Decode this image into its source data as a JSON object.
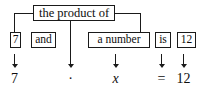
{
  "diagram": {
    "ink_color": "#1a1a1a",
    "background": "#ffffff",
    "phrase_boxes": [
      {
        "id": "product",
        "label": "the product of"
      },
      {
        "id": "seven",
        "label": "7"
      },
      {
        "id": "and",
        "label": "and"
      },
      {
        "id": "number",
        "label": "a number"
      },
      {
        "id": "is",
        "label": "is"
      },
      {
        "id": "twelve",
        "label": "12"
      }
    ],
    "arrows": [
      {
        "id": "arrow-1",
        "glyph": "down-arrow"
      },
      {
        "id": "arrow-2",
        "glyph": "down-arrow"
      },
      {
        "id": "arrow-3",
        "glyph": "down-arrow"
      },
      {
        "id": "arrow-4",
        "glyph": "down-arrow"
      },
      {
        "id": "arrow-5",
        "glyph": "down-arrow"
      }
    ],
    "equation": {
      "term_1": "7",
      "operator_multiply": "·",
      "variable": "x",
      "operator_equals": "=",
      "term_2": "12"
    }
  }
}
